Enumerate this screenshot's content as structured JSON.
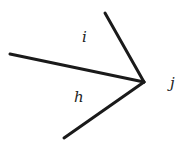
{
  "diagram": {
    "vertex": {
      "x": 144,
      "y": 82
    },
    "edges": [
      {
        "name": "edge-top",
        "x1": 105,
        "y1": 13,
        "x2": 144,
        "y2": 82
      },
      {
        "name": "edge-left",
        "x1": 10,
        "y1": 54,
        "x2": 144,
        "y2": 82
      },
      {
        "name": "edge-bottom",
        "x1": 64,
        "y1": 138,
        "x2": 144,
        "y2": 82
      }
    ],
    "labels": [
      {
        "name": "label-i",
        "text": "i",
        "x": 82,
        "y": 42
      },
      {
        "name": "label-h",
        "text": "h",
        "x": 74,
        "y": 102
      },
      {
        "name": "label-j",
        "text": "j",
        "x": 170,
        "y": 88
      }
    ],
    "colors": {
      "line": "#1a1a1a",
      "text": "#222222",
      "background": "#ffffff"
    }
  }
}
